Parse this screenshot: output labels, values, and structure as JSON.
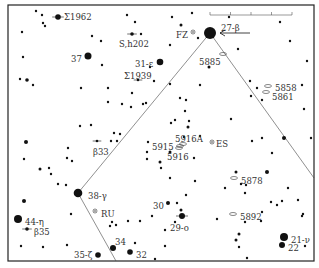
{
  "chart_data": {
    "type": "star-chart",
    "title": "",
    "frame": {
      "x0": 8,
      "y0": 5,
      "x1": 314,
      "y1": 261
    },
    "scale_bar": {
      "x0": 210,
      "x1": 292,
      "y": 15,
      "ticks": 4
    },
    "guide_lines": [
      {
        "from": [
          210,
          33
        ],
        "to": [
          78,
          193
        ]
      },
      {
        "from": [
          78,
          193
        ],
        "to": [
          116,
          261
        ]
      },
      {
        "from": [
          210,
          33
        ],
        "to": [
          314,
          178
        ]
      }
    ],
    "arrow": {
      "from": [
        250,
        33
      ],
      "to": [
        220,
        33
      ],
      "points_to": "27-β"
    },
    "labeled_stars": [
      {
        "id": "sigma1962",
        "label": "Σ1962",
        "x": 58,
        "y": 17,
        "r": 2.8,
        "label_x": 64,
        "label_y": 17,
        "double": true
      },
      {
        "id": "37",
        "label": "37",
        "x": 88,
        "y": 56,
        "r": 3.5,
        "label_x": 71,
        "label_y": 59
      },
      {
        "id": "sh202",
        "label": "S,h202",
        "x": 132,
        "y": 34,
        "r": 1.8,
        "label_x": 119,
        "label_y": 44,
        "double": true
      },
      {
        "id": "31-epsilon",
        "label": "31-ε",
        "x": 160,
        "y": 62,
        "r": 3.3,
        "label_x": 135,
        "label_y": 64
      },
      {
        "id": "sigma1939",
        "label": "Σ1939",
        "x": 138,
        "y": 80,
        "r": 1.3,
        "label_x": 124,
        "label_y": 76,
        "double": true
      },
      {
        "id": "27-beta",
        "label": "27-β",
        "x": 210,
        "y": 33,
        "r": 6,
        "label_x": 221,
        "label_y": 28
      },
      {
        "id": "beta33",
        "label": "β33",
        "x": 97,
        "y": 141,
        "r": 1.3,
        "label_x": 93,
        "label_y": 152,
        "double": true
      },
      {
        "id": "38-gamma",
        "label": "38-γ",
        "x": 78,
        "y": 193,
        "r": 4.3,
        "label_x": 88,
        "label_y": 196
      },
      {
        "id": "44-eta",
        "label": "44-η",
        "x": 18,
        "y": 219,
        "r": 4,
        "label_x": 25,
        "label_y": 222
      },
      {
        "id": "beta35",
        "label": "β35",
        "x": 27,
        "y": 229,
        "r": 1.8,
        "label_x": 34,
        "label_y": 232,
        "double": true
      },
      {
        "id": "35-zeta",
        "label": "35-ζ",
        "x": 98,
        "y": 255,
        "r": 2.8,
        "label_x": 74,
        "label_y": 255
      },
      {
        "id": "34",
        "label": "34",
        "x": 113,
        "y": 248,
        "r": 3,
        "label_x": 115,
        "label_y": 242
      },
      {
        "id": "32",
        "label": "32",
        "x": 130,
        "y": 252,
        "r": 2.8,
        "label_x": 136,
        "label_y": 255
      },
      {
        "id": "30",
        "label": "30",
        "x": 168,
        "y": 203,
        "r": 2,
        "label_x": 153,
        "label_y": 206
      },
      {
        "id": "29-omicron",
        "label": "29-ο",
        "x": 182,
        "y": 216,
        "r": 3,
        "label_x": 170,
        "label_y": 228,
        "double": true
      },
      {
        "id": "21-nu",
        "label": "21-ν",
        "x": 284,
        "y": 237,
        "r": 4,
        "label_x": 291,
        "label_y": 240
      },
      {
        "id": "22",
        "label": "22",
        "x": 282,
        "y": 245,
        "r": 3,
        "label_x": 288,
        "label_y": 248
      }
    ],
    "other_objects": [
      {
        "id": "FZ",
        "label": "FZ",
        "type": "variable",
        "x": 193,
        "y": 32,
        "label_x": 176,
        "label_y": 35
      },
      {
        "id": "ES",
        "label": "ES",
        "type": "variable",
        "x": 212,
        "y": 142,
        "label_x": 216,
        "label_y": 144
      },
      {
        "id": "RU",
        "label": "RU",
        "type": "variable",
        "x": 95,
        "y": 211,
        "label_x": 101,
        "label_y": 214
      },
      {
        "id": "ngc5885",
        "label": "5885",
        "type": "galaxy",
        "x": 223,
        "y": 54,
        "label_x": 199,
        "label_y": 62
      },
      {
        "id": "ngc5858",
        "label": "5858",
        "type": "galaxy",
        "x": 268,
        "y": 86,
        "label_x": 275,
        "label_y": 88
      },
      {
        "id": "ngc5861",
        "label": "5861",
        "type": "galaxy",
        "x": 266,
        "y": 92,
        "label_x": 272,
        "label_y": 97
      },
      {
        "id": "ngc5916A",
        "label": "5916A",
        "type": "galaxy",
        "x": 183,
        "y": 144,
        "label_x": 175,
        "label_y": 139
      },
      {
        "id": "ngc5915",
        "label": "5915",
        "type": "galaxy",
        "x": 180,
        "y": 146,
        "label_x": 152,
        "label_y": 147
      },
      {
        "id": "ngc5916",
        "label": "5916",
        "type": "galaxy",
        "x": 179,
        "y": 148,
        "label_x": 167,
        "label_y": 157
      },
      {
        "id": "ngc5878",
        "label": "5878",
        "type": "galaxy",
        "x": 234,
        "y": 178,
        "label_x": 241,
        "label_y": 181
      },
      {
        "id": "ngc5892",
        "label": "5892",
        "type": "galaxy",
        "x": 233,
        "y": 214,
        "label_x": 240,
        "label_y": 217
      }
    ],
    "field_stars": [
      [
        36,
        11,
        1.2
      ],
      [
        42,
        15,
        1.2
      ],
      [
        43,
        23,
        1.2
      ],
      [
        45,
        26,
        1.2
      ],
      [
        22,
        32,
        1.2
      ],
      [
        92,
        36,
        1.2
      ],
      [
        101,
        41,
        1.2
      ],
      [
        23,
        57,
        1.2
      ],
      [
        102,
        65,
        1.2
      ],
      [
        20,
        79,
        1.2
      ],
      [
        27,
        80,
        1.8
      ],
      [
        33,
        85,
        1.2
      ],
      [
        81,
        88,
        1.2
      ],
      [
        108,
        88,
        1.2
      ],
      [
        127,
        15,
        1.2
      ],
      [
        135,
        22,
        1.2
      ],
      [
        154,
        81,
        1.2
      ],
      [
        150,
        67,
        1.2
      ],
      [
        170,
        45,
        1.2
      ],
      [
        141,
        34,
        1.2
      ],
      [
        172,
        17,
        1.2
      ],
      [
        192,
        13,
        1.2
      ],
      [
        181,
        25,
        1.5
      ],
      [
        198,
        38,
        1.2
      ],
      [
        229,
        17,
        1.2
      ],
      [
        280,
        22,
        1.2
      ],
      [
        290,
        41,
        1.2
      ],
      [
        307,
        61,
        1.2
      ],
      [
        238,
        49,
        1.2
      ],
      [
        209,
        67,
        1.5
      ],
      [
        170,
        84,
        1.2
      ],
      [
        200,
        85,
        1.2
      ],
      [
        257,
        88,
        1.2
      ],
      [
        251,
        96,
        1.2
      ],
      [
        262,
        100,
        1.2
      ],
      [
        302,
        85,
        1.2
      ],
      [
        304,
        109,
        1.2
      ],
      [
        250,
        81,
        1.2
      ],
      [
        132,
        93,
        1.2
      ],
      [
        122,
        104,
        1.2
      ],
      [
        146,
        103,
        1.2
      ],
      [
        131,
        107,
        1.2
      ],
      [
        180,
        98,
        1.2
      ],
      [
        186,
        100,
        1.2
      ],
      [
        189,
        121,
        1.2
      ],
      [
        188,
        127,
        1.5
      ],
      [
        184,
        137,
        1.2
      ],
      [
        170,
        152,
        1.5
      ],
      [
        200,
        136,
        1.2
      ],
      [
        185,
        111,
        1.2
      ],
      [
        175,
        120,
        1.2
      ],
      [
        108,
        102,
        1.2
      ],
      [
        143,
        104,
        1.2
      ],
      [
        171,
        123,
        1.2
      ],
      [
        91,
        125,
        1.2
      ],
      [
        80,
        126,
        1.2
      ],
      [
        26,
        142,
        2
      ],
      [
        24,
        159,
        1.2
      ],
      [
        40,
        169,
        1.5
      ],
      [
        49,
        168,
        1.2
      ],
      [
        51,
        174,
        1.2
      ],
      [
        68,
        148,
        1.2
      ],
      [
        67,
        158,
        1.2
      ],
      [
        72,
        161,
        1.2
      ],
      [
        114,
        133,
        1.2
      ],
      [
        120,
        134,
        1.2
      ],
      [
        111,
        141,
        1.2
      ],
      [
        117,
        141,
        1.2
      ],
      [
        148,
        142,
        1.2
      ],
      [
        147,
        152,
        1.2
      ],
      [
        147,
        159,
        1.2
      ],
      [
        160,
        162,
        1.5
      ],
      [
        161,
        168,
        1.2
      ],
      [
        170,
        178,
        1.2
      ],
      [
        194,
        158,
        1.2
      ],
      [
        231,
        119,
        1.2
      ],
      [
        252,
        141,
        1.2
      ],
      [
        262,
        138,
        1.2
      ],
      [
        284,
        138,
        2
      ],
      [
        311,
        138,
        1.2
      ],
      [
        272,
        153,
        1.2
      ],
      [
        267,
        172,
        2
      ],
      [
        236,
        172,
        1.5
      ],
      [
        246,
        185,
        1.2
      ],
      [
        245,
        193,
        1.2
      ],
      [
        241,
        184,
        1.2
      ],
      [
        225,
        188,
        1.2
      ],
      [
        195,
        181,
        1.2
      ],
      [
        186,
        195,
        1.2
      ],
      [
        271,
        202,
        1.2
      ],
      [
        277,
        205,
        1.2
      ],
      [
        282,
        201,
        1.2
      ],
      [
        288,
        188,
        1.2
      ],
      [
        298,
        200,
        1.2
      ],
      [
        262,
        212,
        1.2
      ],
      [
        303,
        214,
        1.2
      ],
      [
        302,
        216,
        1.2
      ],
      [
        261,
        221,
        1.2
      ],
      [
        245,
        222,
        1.2
      ],
      [
        217,
        219,
        1.2
      ],
      [
        239,
        234,
        1.5
      ],
      [
        236,
        240,
        1.5
      ],
      [
        239,
        247,
        1.2
      ],
      [
        247,
        258,
        1.2
      ],
      [
        305,
        246,
        1.2
      ],
      [
        181,
        210,
        1.5
      ],
      [
        177,
        203,
        1.2
      ],
      [
        175,
        222,
        1.2
      ],
      [
        165,
        230,
        1.2
      ],
      [
        152,
        216,
        1.2
      ],
      [
        165,
        246,
        1.2
      ],
      [
        112,
        222,
        1.2
      ],
      [
        116,
        225,
        1.2
      ],
      [
        128,
        221,
        1.2
      ],
      [
        140,
        221,
        1.2
      ],
      [
        135,
        243,
        1.2
      ],
      [
        155,
        259,
        1.2
      ],
      [
        71,
        214,
        1.2
      ],
      [
        66,
        185,
        1.2
      ],
      [
        58,
        184,
        1.2
      ],
      [
        24,
        201,
        2
      ],
      [
        21,
        246,
        1.2
      ],
      [
        43,
        247,
        1.2
      ],
      [
        67,
        245,
        1.2
      ],
      [
        110,
        226,
        1.2
      ]
    ]
  }
}
